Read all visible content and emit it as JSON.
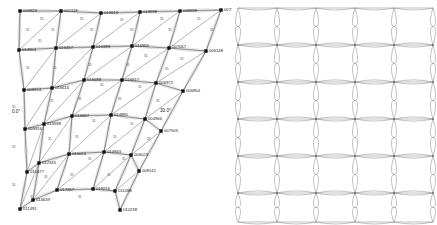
{
  "figure": {
    "title": "",
    "background_color": "#ffffff",
    "line_color": "#4a4a4a",
    "node_color": "#111111",
    "ghost_line_color": "#a8a8a8"
  },
  "panels": [
    {
      "id": "left",
      "name": "deformed-mesh",
      "node_marker": "square",
      "has_labels": true
    },
    {
      "id": "right",
      "name": "reference-mesh",
      "node_marker": "dot",
      "has_labels": false
    }
  ],
  "left_panel": {
    "angle_annotations": [
      {
        "text": "0.0°",
        "x": 12,
        "y": 113
      },
      {
        "text": "30.0°",
        "x": 160,
        "y": 112
      }
    ],
    "nodes": [
      {
        "id": "006824",
        "label": "006824",
        "x": 20,
        "y": 11,
        "lx": 23,
        "ly": 10
      },
      {
        "id": "007118",
        "label": "007118",
        "x": 61,
        "y": 11,
        "lx": 64,
        "ly": 10
      },
      {
        "id": "016613",
        "label": "016613",
        "x": 101,
        "y": 13,
        "lx": 104,
        "ly": 12
      },
      {
        "id": "018698",
        "label": "018698",
        "x": 140,
        "y": 12,
        "lx": 143,
        "ly": 11
      },
      {
        "id": "008598",
        "label": "008598",
        "x": 180,
        "y": 11,
        "lx": 183,
        "ly": 10
      },
      {
        "id": "007701",
        "label": "007701",
        "x": 221,
        "y": 10,
        "lx": 224,
        "ly": 9
      },
      {
        "id": "014904",
        "label": "014904",
        "x": 19,
        "y": 50,
        "lx": 22,
        "ly": 49
      },
      {
        "id": "016457",
        "label": "016457",
        "x": 56,
        "y": 48,
        "lx": 59,
        "ly": 47
      },
      {
        "id": "016399",
        "label": "016399",
        "x": 93,
        "y": 47,
        "lx": 96,
        "ly": 46
      },
      {
        "id": "016965",
        "label": "016965",
        "x": 132,
        "y": 46,
        "lx": 135,
        "ly": 45
      },
      {
        "id": "007057",
        "label": "007057",
        "x": 169,
        "y": 48,
        "lx": 172,
        "ly": 46
      },
      {
        "id": "006148",
        "label": "006148",
        "x": 206,
        "y": 51,
        "lx": 209,
        "ly": 50
      },
      {
        "id": "008974",
        "label": "008974",
        "x": 24,
        "y": 90,
        "lx": 27,
        "ly": 89
      },
      {
        "id": "016616",
        "label": "016616",
        "x": 52,
        "y": 88,
        "lx": 55,
        "ly": 87
      },
      {
        "id": "016688",
        "label": "016688",
        "x": 84,
        "y": 80,
        "lx": 87,
        "ly": 79
      },
      {
        "id": "016617",
        "label": "016617",
        "x": 122,
        "y": 80,
        "lx": 125,
        "ly": 79
      },
      {
        "id": "006972",
        "label": "006972",
        "x": 156,
        "y": 83,
        "lx": 159,
        "ly": 82
      },
      {
        "id": "006854",
        "label": "006854",
        "x": 183,
        "y": 91,
        "lx": 186,
        "ly": 90
      },
      {
        "id": "005916",
        "label": "005916",
        "x": 25,
        "y": 129,
        "lx": 28,
        "ly": 128
      },
      {
        "id": "015598",
        "label": "015598",
        "x": 44,
        "y": 124,
        "lx": 47,
        "ly": 123
      },
      {
        "id": "016667",
        "label": "016667",
        "x": 72,
        "y": 116,
        "lx": 75,
        "ly": 115
      },
      {
        "id": "014991",
        "label": "014991",
        "x": 111,
        "y": 115,
        "lx": 114,
        "ly": 114
      },
      {
        "id": "004966",
        "label": "004966",
        "x": 145,
        "y": 119,
        "lx": 148,
        "ly": 118
      },
      {
        "id": "007505",
        "label": "007505",
        "x": 161,
        "y": 131,
        "lx": 164,
        "ly": 130
      },
      {
        "id": "010477",
        "label": "010477",
        "x": 27,
        "y": 172,
        "lx": 30,
        "ly": 171
      },
      {
        "id": "012345",
        "label": "012345",
        "x": 39,
        "y": 163,
        "lx": 42,
        "ly": 162
      },
      {
        "id": "016024",
        "label": "016024",
        "x": 69,
        "y": 154,
        "lx": 72,
        "ly": 153
      },
      {
        "id": "014943",
        "label": "014943",
        "x": 104,
        "y": 152,
        "lx": 107,
        "ly": 151
      },
      {
        "id": "006023",
        "label": "006023",
        "x": 131,
        "y": 155,
        "lx": 134,
        "ly": 154
      },
      {
        "id": "008141",
        "label": "008141",
        "x": 139,
        "y": 171,
        "lx": 142,
        "ly": 170
      },
      {
        "id": "011491",
        "label": "011491",
        "x": 20,
        "y": 209,
        "lx": 23,
        "ly": 208
      },
      {
        "id": "014639",
        "label": "014639",
        "x": 33,
        "y": 200,
        "lx": 36,
        "ly": 199
      },
      {
        "id": "017457",
        "label": "017457",
        "x": 57,
        "y": 190,
        "lx": 60,
        "ly": 189
      },
      {
        "id": "019216",
        "label": "019216",
        "x": 93,
        "y": 189,
        "lx": 96,
        "ly": 188
      },
      {
        "id": "011098",
        "label": "011098",
        "x": 115,
        "y": 191,
        "lx": 118,
        "ly": 190
      },
      {
        "id": "010238",
        "label": "010238",
        "x": 120,
        "y": 210,
        "lx": 123,
        "ly": 209
      }
    ],
    "element_labels": [
      {
        "text": "35",
        "x": 40,
        "y": 20
      },
      {
        "text": "35",
        "x": 80,
        "y": 20
      },
      {
        "text": "35",
        "x": 120,
        "y": 21
      },
      {
        "text": "35",
        "x": 160,
        "y": 20
      },
      {
        "text": "35",
        "x": 197,
        "y": 20
      },
      {
        "text": "35",
        "x": 26,
        "y": 31
      },
      {
        "text": "35",
        "x": 51,
        "y": 31
      },
      {
        "text": "35",
        "x": 90,
        "y": 31
      },
      {
        "text": "35",
        "x": 130,
        "y": 31
      },
      {
        "text": "35",
        "x": 168,
        "y": 31
      },
      {
        "text": "35",
        "x": 210,
        "y": 31
      },
      {
        "text": "35",
        "x": 38,
        "y": 42
      },
      {
        "text": "35",
        "x": 144,
        "y": 57
      },
      {
        "text": "35",
        "x": 180,
        "y": 60
      },
      {
        "text": "35",
        "x": 26,
        "y": 69
      },
      {
        "text": "35",
        "x": 53,
        "y": 69
      },
      {
        "text": "35",
        "x": 88,
        "y": 66
      },
      {
        "text": "35",
        "x": 126,
        "y": 66
      },
      {
        "text": "35",
        "x": 165,
        "y": 70
      },
      {
        "text": "35",
        "x": 100,
        "y": 86
      },
      {
        "text": "35",
        "x": 138,
        "y": 88
      },
      {
        "text": "35",
        "x": 50,
        "y": 102
      },
      {
        "text": "35",
        "x": 78,
        "y": 100
      },
      {
        "text": "35",
        "x": 118,
        "y": 100
      },
      {
        "text": "35",
        "x": 156,
        "y": 102
      },
      {
        "text": "35",
        "x": 12,
        "y": 108
      },
      {
        "text": "35",
        "x": 92,
        "y": 122
      },
      {
        "text": "35",
        "x": 130,
        "y": 125
      },
      {
        "text": "35",
        "x": 48,
        "y": 140
      },
      {
        "text": "35",
        "x": 75,
        "y": 138
      },
      {
        "text": "35",
        "x": 113,
        "y": 138
      },
      {
        "text": "35",
        "x": 147,
        "y": 140
      },
      {
        "text": "35",
        "x": 12,
        "y": 148
      },
      {
        "text": "35",
        "x": 88,
        "y": 160
      },
      {
        "text": "35",
        "x": 122,
        "y": 160
      },
      {
        "text": "35",
        "x": 44,
        "y": 178
      },
      {
        "text": "35",
        "x": 70,
        "y": 176
      },
      {
        "text": "35",
        "x": 107,
        "y": 176
      },
      {
        "text": "35",
        "x": 12,
        "y": 186
      },
      {
        "text": "35",
        "x": 30,
        "y": 198
      },
      {
        "text": "35",
        "x": 78,
        "y": 198
      }
    ]
  },
  "right_panel": {
    "grid": {
      "columns": 5,
      "rows": 6
    },
    "x_positions": [
      6,
      45,
      84,
      123,
      162,
      201
    ],
    "y_positions": [
      8,
      45,
      82,
      119,
      156,
      193,
      222
    ],
    "shape": "bowtie-lens-cell"
  }
}
